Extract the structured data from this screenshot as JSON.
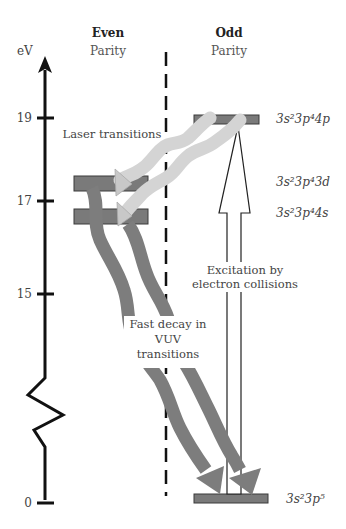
{
  "columns": {
    "even": {
      "title": "Even",
      "subtitle": "Parity"
    },
    "odd": {
      "title": "Odd",
      "subtitle": "Parity"
    }
  },
  "axis": {
    "unit": "eV",
    "ticks": [
      {
        "label": "19",
        "value": 19
      },
      {
        "label": "17",
        "value": 17
      },
      {
        "label": "15",
        "value": 15
      },
      {
        "label": "0",
        "value": 0
      }
    ],
    "axis_break": true
  },
  "levels": [
    {
      "id": "4p",
      "config": "3s²3p⁴4p",
      "parity": "odd",
      "energy_eV": 19
    },
    {
      "id": "3d",
      "config": "3s²3p⁴3d",
      "parity": "even",
      "energy_eV": 17.5
    },
    {
      "id": "4s",
      "config": "3s²3p⁴4s",
      "parity": "even",
      "energy_eV": 16.8
    },
    {
      "id": "ground",
      "config": "3s²3p⁵",
      "parity": "odd",
      "energy_eV": 0
    }
  ],
  "annotations": {
    "laser": "Laser transitions",
    "excitation_line1": "Excitation by",
    "excitation_line2": "electron collisions",
    "decay_line1": "Fast decay in",
    "decay_line2": "VUV",
    "decay_line3": "transitions"
  },
  "colors": {
    "level_fill": "#7a7a7a",
    "level_stroke": "#3a3a3a",
    "laser": "#d4d4d4",
    "decay": "#7d7d7d",
    "axis": "#111111"
  }
}
